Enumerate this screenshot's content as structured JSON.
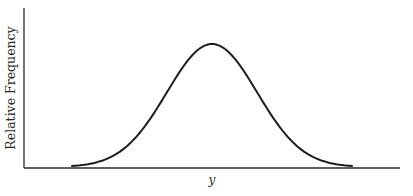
{
  "chart_data": {
    "type": "line",
    "title": "",
    "xlabel": "y",
    "ylabel": "Relative Frequency",
    "x": [
      0.0,
      0.1,
      0.2,
      0.3,
      0.4,
      0.5,
      0.6,
      0.7,
      0.8,
      0.9,
      1.0
    ],
    "series": [
      {
        "name": "Relative Frequency",
        "values": [
          0.0,
          0.04,
          0.16,
          0.42,
          0.78,
          1.0,
          0.78,
          0.42,
          0.16,
          0.04,
          0.0
        ]
      }
    ],
    "xlim": [
      0,
      1
    ],
    "ylim": [
      0,
      1.2
    ],
    "grid": false,
    "legend": "none",
    "ticks": "none",
    "colors": {
      "curve": "#1e1e1e",
      "axis": "#2a2a2a",
      "background": "#ffffff"
    }
  }
}
